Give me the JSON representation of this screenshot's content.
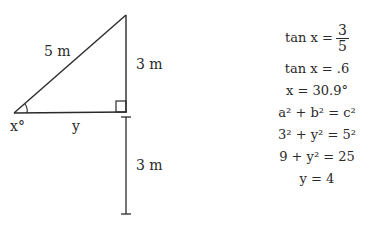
{
  "diagram": {
    "hypotenuse_label": "5 m",
    "vertical_side_label": "3 m",
    "extension_label": "3 m",
    "base_label": "y",
    "angle_label": "x°"
  },
  "equations": {
    "eq1_lhs": "tan x =",
    "eq1_num": "3",
    "eq1_den": "5",
    "eq2": "tan x = .6",
    "eq3": "x = 30.9°",
    "eq4": "a² + b² = c²",
    "eq5": "3² + y² = 5²",
    "eq6": "9 + y² = 25",
    "eq7": "y = 4"
  }
}
